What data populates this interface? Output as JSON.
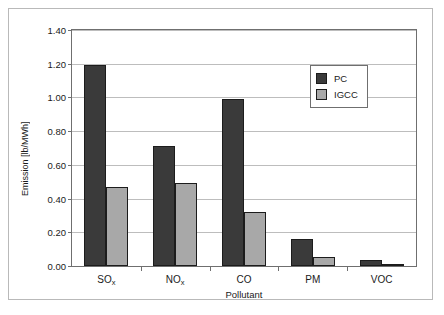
{
  "chart_data": {
    "type": "bar",
    "title": "",
    "xlabel": "Pollutant",
    "ylabel": "Emission [lb/MWh]",
    "categories": [
      "SOx",
      "NOx",
      "CO",
      "PM",
      "VOC"
    ],
    "category_labels_html": [
      "SO<sub>x</sub>",
      "NO<sub>x</sub>",
      "CO",
      "PM",
      "VOC"
    ],
    "series": [
      {
        "name": "PC",
        "color": "#3a3a3a",
        "values": [
          1.19,
          0.71,
          0.99,
          0.16,
          0.035
        ]
      },
      {
        "name": "IGCC",
        "color": "#a8a8a8",
        "values": [
          0.47,
          0.49,
          0.32,
          0.055,
          0.01
        ]
      }
    ],
    "ylim": [
      0.0,
      1.4
    ],
    "ytick_labels": [
      "0.00",
      "0.20",
      "0.40",
      "0.60",
      "0.80",
      "1.00",
      "1.20",
      "1.40"
    ],
    "ytick_values": [
      0.0,
      0.2,
      0.4,
      0.6,
      0.8,
      1.0,
      1.2,
      1.4
    ],
    "grid": true,
    "grid_axis": "y",
    "legend_position": "upper-right-inside",
    "legend_entries": [
      "PC",
      "IGCC"
    ]
  }
}
